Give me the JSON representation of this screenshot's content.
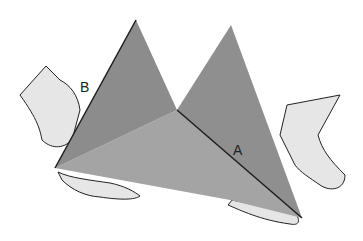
{
  "figure": {
    "labels": {
      "edge_b": "B",
      "edge_a": "A"
    },
    "colors": {
      "left_face": "#8c8c8c",
      "right_face": "#8f8f8f",
      "bottom_face": "#a4a4a4",
      "hand_fill": "#e6e6e6",
      "outline": "#1e1e1e"
    }
  }
}
